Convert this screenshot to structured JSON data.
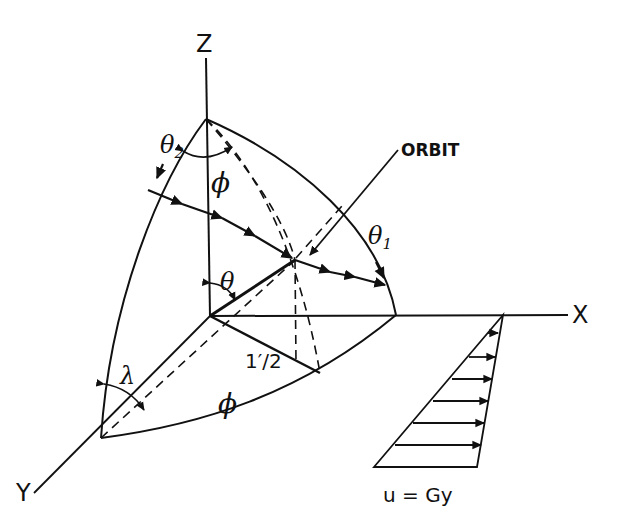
{
  "figure": {
    "type": "3D orbit geometry diagram on spherical surface",
    "ink_color": "#111111",
    "background": "#ffffff"
  },
  "axes": {
    "z_label": "Z",
    "x_label": "X",
    "y_label": "Y"
  },
  "labels": {
    "orbit": "ORBIT",
    "theta": "θ",
    "theta1": "θ",
    "theta1_sub": "1",
    "theta2": "θ",
    "theta2_sub": "2",
    "phi_top": "ϕ",
    "phi_bottom": "ϕ",
    "lambda": "λ",
    "half_length": "1′/2",
    "shear_flow": "u = Gy"
  }
}
